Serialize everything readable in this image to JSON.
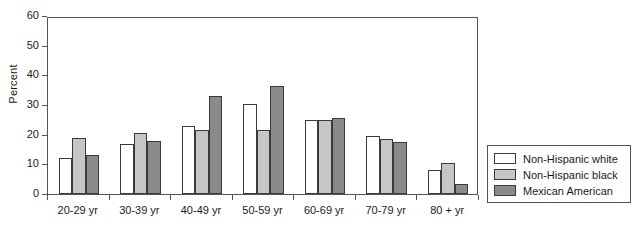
{
  "chart_data": {
    "type": "bar",
    "title": "",
    "xlabel": "",
    "ylabel": "Percent",
    "ylim": [
      0,
      60
    ],
    "yticks": [
      0,
      10,
      20,
      30,
      40,
      50,
      60
    ],
    "grid": false,
    "legend_position": "right-outside",
    "categories": [
      "20-29 yr",
      "30-39 yr",
      "40-49 yr",
      "50-59 yr",
      "60-69 yr",
      "70-79 yr",
      "80 + yr"
    ],
    "series": [
      {
        "name": "Non-Hispanic white",
        "color": "#ffffff",
        "values": [
          12,
          17,
          23,
          30.5,
          25,
          19.5,
          8
        ]
      },
      {
        "name": "Non-Hispanic black",
        "color": "#c6c6c6",
        "values": [
          19,
          20.5,
          21.5,
          21.5,
          25,
          18.5,
          10.5
        ]
      },
      {
        "name": "Mexican American",
        "color": "#8a8a8a",
        "values": [
          13,
          18,
          33,
          36.5,
          25.5,
          17.5,
          3.5
        ]
      }
    ]
  },
  "legend": {
    "items": [
      {
        "label": "Non-Hispanic white",
        "color": "#ffffff"
      },
      {
        "label": "Non-Hispanic black",
        "color": "#c6c6c6"
      },
      {
        "label": "Mexican American",
        "color": "#8a8a8a"
      }
    ]
  }
}
